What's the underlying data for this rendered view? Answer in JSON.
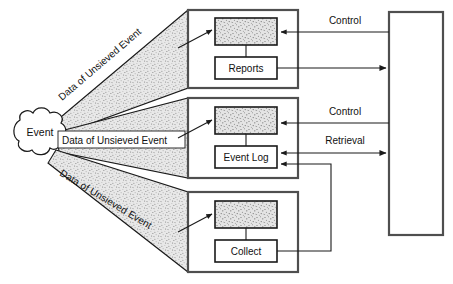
{
  "diagram": {
    "colors": {
      "stroke": "#1a1a1a",
      "panel_border": "#555555",
      "stipple_fill": "#d9d9d9",
      "stipple_dot": "#6b6b6b",
      "wedge_fill": "#dcdcdc",
      "wedge_dot": "#777777",
      "background": "#ffffff",
      "text": "#111111"
    },
    "source_node": {
      "label": "Event",
      "shape": "cloud"
    },
    "flow_labels": [
      {
        "id": "flow-top",
        "text": "Data of Unsieved Event",
        "orientation": "angled-up"
      },
      {
        "id": "flow-middle",
        "text": "Data of Unsieved Event",
        "orientation": "horizontal"
      },
      {
        "id": "flow-bottom",
        "text": "Data of Unsieved Event",
        "orientation": "angled-down"
      }
    ],
    "panels": [
      {
        "id": "panel-reports",
        "process_label": "",
        "process_fill": "stippled",
        "store_label": "Reports"
      },
      {
        "id": "panel-event-log",
        "process_label": "",
        "process_fill": "stippled",
        "store_label": "Event Log"
      },
      {
        "id": "panel-collect",
        "process_label": "",
        "process_fill": "stippled",
        "store_label": "Collect"
      }
    ],
    "right_block": {
      "label": ""
    },
    "connector_labels": [
      {
        "id": "control-top",
        "text": "Control"
      },
      {
        "id": "control-middle",
        "text": "Control"
      },
      {
        "id": "retrieval",
        "text": "Retrieval"
      }
    ]
  }
}
